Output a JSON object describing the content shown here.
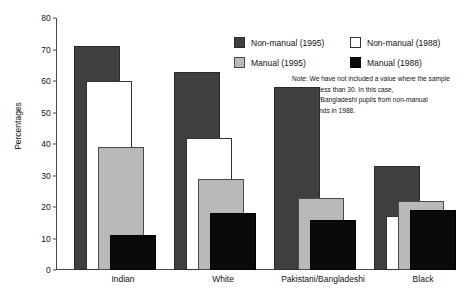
{
  "chart_data": {
    "type": "bar",
    "title": "",
    "xlabel": "",
    "ylabel": "Percentages",
    "ylim": [
      0,
      80
    ],
    "yticks": [
      0,
      10,
      20,
      30,
      40,
      50,
      60,
      70,
      80
    ],
    "grid": false,
    "legend_position": "top-right",
    "categories": [
      "Indian",
      "White",
      "Pakistani/Bangladeshi",
      "Black"
    ],
    "series": [
      {
        "name": "Non-manual (1995)",
        "color": "#3f3f3f",
        "values": [
          71,
          63,
          58,
          33
        ]
      },
      {
        "name": "Non-manual (1988)",
        "color": "#ffffff",
        "values": [
          60,
          42,
          null,
          17
        ]
      },
      {
        "name": "Manual (1995)",
        "color": "#b9b9b9",
        "values": [
          39,
          29,
          23,
          22
        ]
      },
      {
        "name": "Manual (1988)",
        "color": "#0a0a0a",
        "values": [
          11,
          18,
          16,
          19
        ]
      }
    ],
    "annotations": [
      "Note: We have not included a value where the sample size was less than 30. In this case, Pakistani/Bangladeshi pupils from non-manual backgrounds in 1988."
    ]
  },
  "legend": {
    "entries": [
      {
        "label": "Non-manual (1995)",
        "swatch": "nm95"
      },
      {
        "label": "Manual (1995)",
        "swatch": "m95"
      },
      {
        "label": "Non-manual (1988)",
        "swatch": "nm88"
      },
      {
        "label": "Manual (1988)",
        "swatch": "m88"
      }
    ]
  },
  "note": {
    "text": "Note: We have not included a value where the sample size was less than 30. In this case, Pakistani/Bangladeshi pupils from non-manual backgrounds in 1988."
  },
  "axis": {
    "y_label": "Percentages",
    "y_ticks": [
      "0",
      "10",
      "20",
      "30",
      "40",
      "50",
      "60",
      "70",
      "80"
    ],
    "x_ticks": [
      "Indian",
      "White",
      "Pakistani/Bangladeshi",
      "Black"
    ]
  }
}
